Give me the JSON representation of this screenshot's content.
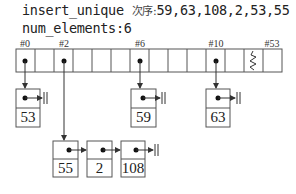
{
  "header": {
    "title_code": "insert_unique",
    "title_cjk": "次序:",
    "title_sequence": "59,63,108,2,53,55",
    "num_elements_label": "num_elements:6"
  },
  "buckets": {
    "count_visible": 14,
    "labels": [
      {
        "text": "#0",
        "bucket": 0
      },
      {
        "text": "#2",
        "bucket": 2
      },
      {
        "text": "#6",
        "bucket": 6
      },
      {
        "text": "#10",
        "bucket": 10
      },
      {
        "text": "#53",
        "bucket": 53
      }
    ],
    "break_symbol": "zigzag"
  },
  "chains": [
    {
      "bucket": "#0",
      "nodes": [
        "53"
      ]
    },
    {
      "bucket": "#2",
      "nodes": [
        "55",
        "2",
        "108"
      ]
    },
    {
      "bucket": "#6",
      "nodes": [
        "59"
      ]
    },
    {
      "bucket": "#10",
      "nodes": [
        "63"
      ]
    }
  ],
  "colors": {
    "stroke": "#555555",
    "text": "#222222",
    "background": "#ffffff"
  }
}
